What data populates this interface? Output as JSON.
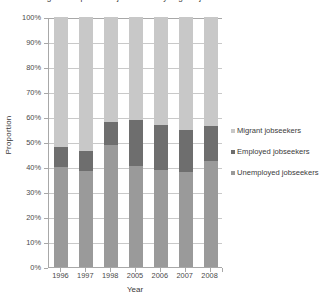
{
  "chart_data": {
    "type": "bar",
    "subtype": "stacked-percentage-column",
    "title": "Figure: Proportion of jobseekers by migrant jobseeker status",
    "xlabel": "Year",
    "ylabel": "Proportion",
    "categories": [
      "1996",
      "1997",
      "1998",
      "2005",
      "2006",
      "2007",
      "2008"
    ],
    "ylim": [
      0,
      100
    ],
    "yticks": [
      0,
      10,
      20,
      30,
      40,
      50,
      60,
      70,
      80,
      90,
      100
    ],
    "ytick_labels": [
      "0%",
      "10%",
      "20%",
      "30%",
      "40%",
      "50%",
      "60%",
      "70%",
      "80%",
      "90%",
      "100%"
    ],
    "grid": true,
    "legend_position": "right",
    "stack_order_bottom_to_top": [
      "Unemployed jobseekers",
      "Employed jobseekers",
      "Migrant jobseekers"
    ],
    "series": [
      {
        "name": "Unemployed jobseekers",
        "color": "#9a9a9a",
        "values": [
          40.0,
          38.5,
          49.0,
          40.5,
          39.0,
          38.0,
          42.5
        ]
      },
      {
        "name": "Employed jobseekers",
        "color": "#6e6e6e",
        "values": [
          8.0,
          8.0,
          9.0,
          18.5,
          18.0,
          17.0,
          14.0
        ]
      },
      {
        "name": "Migrant jobseekers",
        "color": "#c8c8c8",
        "values": [
          52.0,
          53.5,
          42.0,
          41.0,
          43.0,
          45.0,
          43.5
        ]
      }
    ],
    "cumulative_tops": {
      "unemployed": [
        40.0,
        38.5,
        49.0,
        40.5,
        39.0,
        38.0,
        42.5
      ],
      "employed": [
        48.0,
        46.5,
        58.0,
        59.0,
        57.0,
        55.0,
        56.5
      ],
      "migrant": [
        100,
        100,
        100,
        100,
        100,
        100,
        100
      ]
    }
  },
  "legend": {
    "items": [
      {
        "label": "Migrant jobseekers",
        "color": "#c8c8c8"
      },
      {
        "label": "Employed jobseekers",
        "color": "#6e6e6e"
      },
      {
        "label": "Unemployed jobseekers",
        "color": "#9a9a9a"
      }
    ]
  },
  "colors": {
    "gridline": "#c9c9c9",
    "axis": "#a8a8a8",
    "text": "#3a3a3a",
    "background": "#ffffff"
  }
}
